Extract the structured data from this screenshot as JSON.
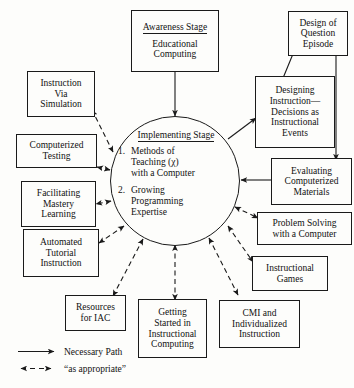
{
  "diagram": {
    "center": {
      "heading": "Implementing Stage",
      "items": [
        {
          "number": "1.",
          "lines": [
            "Methods of",
            "Teaching (χ)",
            "with a Computer"
          ]
        },
        {
          "number": "2.",
          "lines": [
            "Growing",
            "Programming",
            "Expertise"
          ]
        }
      ]
    },
    "nodes": [
      {
        "id": "awareness",
        "heading": "Awareness Stage",
        "lines": [
          "Educational",
          "Computing"
        ]
      },
      {
        "id": "design-question-episode",
        "lines": [
          "Design of",
          "Question",
          "Episode"
        ]
      },
      {
        "id": "designing-instruction",
        "lines": [
          "Designing",
          "Instruction—",
          "Decisions as",
          "Instructional",
          "Events"
        ]
      },
      {
        "id": "evaluating-materials",
        "lines": [
          "Evaluating",
          "Computerized",
          "Materials"
        ]
      },
      {
        "id": "problem-solving",
        "lines": [
          "Problem Solving",
          "with a Computer"
        ]
      },
      {
        "id": "instructional-games",
        "lines": [
          "Instructional",
          "Games"
        ]
      },
      {
        "id": "cmi-individualized",
        "lines": [
          "CMI and",
          "Individualized",
          "Instruction"
        ]
      },
      {
        "id": "getting-started",
        "lines": [
          "Getting",
          "Started in",
          "Instructional",
          "Computing"
        ]
      },
      {
        "id": "resources-iac",
        "lines": [
          "Resources",
          "for IAC"
        ]
      },
      {
        "id": "automated-tutorial",
        "lines": [
          "Automated",
          "Tutorial",
          "Instruction"
        ]
      },
      {
        "id": "facilitating-mastery",
        "lines": [
          "Facilitating",
          "Mastery",
          "Learning"
        ]
      },
      {
        "id": "computerized-testing",
        "lines": [
          "Computerized",
          "Testing"
        ]
      },
      {
        "id": "instruction-simulation",
        "lines": [
          "Instruction",
          "Via",
          "Simulation"
        ]
      }
    ],
    "legend": [
      {
        "id": "necessary-path",
        "label": "Necessary Path",
        "style": "solid"
      },
      {
        "id": "as-appropriate",
        "label": "“as appropriate”",
        "style": "dashed"
      }
    ],
    "colors": {
      "stroke": "#1a1a1a",
      "text": "#111111",
      "background": "#fdfdfb"
    }
  }
}
